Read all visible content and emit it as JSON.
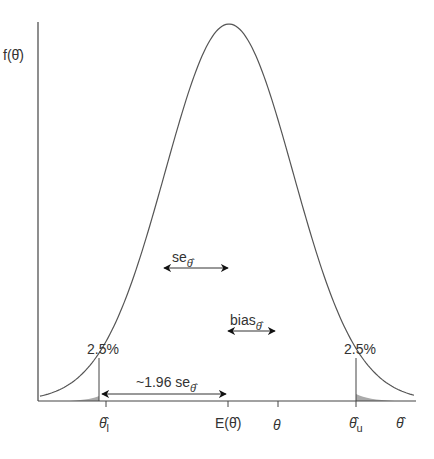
{
  "diagram": {
    "type": "sampling-distribution",
    "y_axis_label": "f(θ̂)",
    "x_axis_label": "θ̂",
    "curve": {
      "shape": "normal",
      "peak_x": 229,
      "peak_y": 24,
      "sd_px": 64
    },
    "ticks": [
      {
        "id": "theta_l",
        "label": "θ̂",
        "subscript": "l",
        "x": 106
      },
      {
        "id": "e_theta",
        "label": "E(θ̂)",
        "x": 228
      },
      {
        "id": "theta",
        "label": "θ",
        "x": 278
      },
      {
        "id": "theta_u",
        "label": "θ̂",
        "subscript": "u",
        "x": 356
      }
    ],
    "annotations": {
      "se": {
        "label": "se",
        "subscript": "θ̂"
      },
      "bias": {
        "label": "bias",
        "subscript": "θ̂"
      },
      "ci": {
        "label": "~1.96 se",
        "subscript": "θ̂"
      },
      "left_tail": {
        "label": "2.5%"
      },
      "right_tail": {
        "label": "2.5%"
      }
    },
    "colors": {
      "line": "#555555",
      "axis": "#444444",
      "tail_fill": "#999999",
      "text": "#333333"
    }
  }
}
